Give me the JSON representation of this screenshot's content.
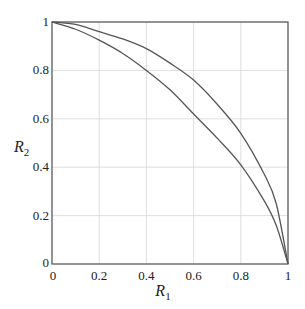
{
  "chart_data": {
    "type": "line",
    "title": "",
    "xlabel": "R1",
    "ylabel": "R2",
    "xlim": [
      0,
      1
    ],
    "ylim": [
      0,
      1
    ],
    "grid": true,
    "legend": null,
    "xticks": [
      "0",
      "0.2",
      "0.4",
      "0.6",
      "0.8",
      "1"
    ],
    "yticks": [
      "0",
      "0.2",
      "0.4",
      "0.6",
      "0.8",
      "1"
    ],
    "series": [
      {
        "name": "outer curve",
        "color": "#555555",
        "x": [
          0,
          0.1,
          0.2,
          0.3,
          0.4,
          0.5,
          0.6,
          0.7,
          0.8,
          0.9,
          0.95,
          1.0
        ],
        "y": [
          1.0,
          0.99,
          0.96,
          0.93,
          0.89,
          0.83,
          0.76,
          0.66,
          0.54,
          0.37,
          0.25,
          0.0
        ]
      },
      {
        "name": "inner curve",
        "color": "#555555",
        "x": [
          0,
          0.1,
          0.2,
          0.3,
          0.4,
          0.5,
          0.6,
          0.7,
          0.8,
          0.9,
          0.95,
          1.0
        ],
        "y": [
          1.0,
          0.97,
          0.925,
          0.87,
          0.8,
          0.72,
          0.62,
          0.52,
          0.41,
          0.26,
          0.16,
          0.0
        ]
      }
    ]
  },
  "labels": {
    "x_main": "R",
    "x_sub": "1",
    "y_main": "R",
    "y_sub": "2"
  }
}
